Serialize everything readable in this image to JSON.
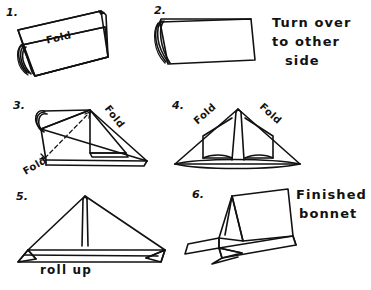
{
  "document": {
    "title": "Paper bonnet folding instructions",
    "ink_color": "#111111",
    "background_color": "#ffffff"
  },
  "steps": [
    {
      "number": "1.",
      "labels": [
        "Fold"
      ]
    },
    {
      "number": "2.",
      "labels": [],
      "note": "Turn over\nto other\nside",
      "note_lines": [
        "Turn over",
        "to other",
        "side"
      ]
    },
    {
      "number": "3.",
      "labels": [
        "Fold",
        "Fold"
      ]
    },
    {
      "number": "4.",
      "labels": [
        "Fold",
        "Fold"
      ]
    },
    {
      "number": "5.",
      "labels": [
        "roll up"
      ]
    },
    {
      "number": "6.",
      "labels": [],
      "note": "Finished\nbonnet",
      "note_lines": [
        "Finished",
        "bonnet"
      ]
    }
  ],
  "text": {
    "step1_num": "1.",
    "step1_fold": "Fold",
    "step2_num": "2.",
    "step2_note_l1": "Turn over",
    "step2_note_l2": "to other",
    "step2_note_l3": "side",
    "step3_num": "3.",
    "step3_fold_right": "Fold",
    "step3_fold_left": "Fold",
    "step4_num": "4.",
    "step4_fold_left": "Fold",
    "step4_fold_right": "Fold",
    "step5_num": "5.",
    "step5_rollup": "roll up",
    "step6_num": "6.",
    "step6_note_l1": "Finished",
    "step6_note_l2": "bonnet"
  }
}
